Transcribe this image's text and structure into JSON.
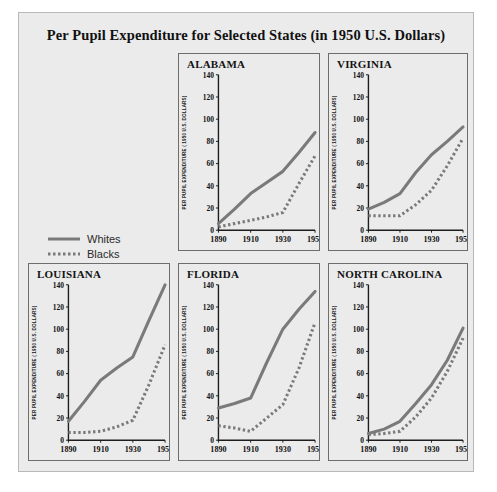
{
  "figure": {
    "title": "Per Pupil Expenditure for Selected States (in 1950 U.S. Dollars)"
  },
  "legend": {
    "whites_label": "Whites",
    "blacks_label": "Blacks",
    "whites_style": "solid",
    "blacks_style": "dotted",
    "line_color": "#7a7a7a"
  },
  "axis": {
    "ylabel": "PER PUPIL EXPENDITURE ( 1950 U.S. DOLLARS)",
    "yticks": [
      0,
      20,
      40,
      60,
      80,
      100,
      120,
      140
    ],
    "xticks": [
      1890,
      1910,
      1930,
      1950
    ],
    "ylim": [
      0,
      140
    ],
    "xlim": [
      1890,
      1950
    ]
  },
  "chart_data": [
    {
      "type": "line",
      "title": "ALABAMA",
      "xlabel": "",
      "ylabel": "PER PUPIL EXPENDITURE ( 1950 U.S. DOLLARS)",
      "xlim": [
        1890,
        1950
      ],
      "ylim": [
        0,
        140
      ],
      "xticks": [
        1890,
        1910,
        1930,
        1950
      ],
      "yticks": [
        0,
        20,
        40,
        60,
        80,
        100,
        120,
        140
      ],
      "grid": false,
      "legend_position": "figure-left",
      "x": [
        1890,
        1900,
        1910,
        1920,
        1930,
        1940,
        1950
      ],
      "series": [
        {
          "name": "Whites",
          "style": "solid",
          "values": [
            6,
            19,
            33,
            43,
            53,
            70,
            88
          ]
        },
        {
          "name": "Blacks",
          "style": "dotted",
          "values": [
            3,
            6,
            9,
            12,
            16,
            42,
            67
          ]
        }
      ]
    },
    {
      "type": "line",
      "title": "VIRGINIA",
      "xlabel": "",
      "ylabel": "PER PUPIL EXPENDITURE ( 1950 U.S. DOLLARS)",
      "xlim": [
        1890,
        1950
      ],
      "ylim": [
        0,
        140
      ],
      "xticks": [
        1890,
        1910,
        1930,
        1950
      ],
      "yticks": [
        0,
        20,
        40,
        60,
        80,
        100,
        120,
        140
      ],
      "grid": false,
      "legend_position": "figure-left",
      "x": [
        1890,
        1900,
        1910,
        1920,
        1930,
        1940,
        1950
      ],
      "series": [
        {
          "name": "Whites",
          "style": "solid",
          "values": [
            19,
            25,
            33,
            52,
            68,
            80,
            93
          ]
        },
        {
          "name": "Blacks",
          "style": "dotted",
          "values": [
            13,
            13,
            13,
            23,
            36,
            58,
            83
          ]
        }
      ]
    },
    {
      "type": "line",
      "title": "LOUISIANA",
      "xlabel": "",
      "ylabel": "PER PUPIL EXPENDITURE ( 1950 U.S. DOLLARS)",
      "xlim": [
        1890,
        1950
      ],
      "ylim": [
        0,
        140
      ],
      "xticks": [
        1890,
        1910,
        1930,
        1950
      ],
      "yticks": [
        0,
        20,
        40,
        60,
        80,
        100,
        120,
        140
      ],
      "grid": false,
      "legend_position": "figure-left",
      "x": [
        1890,
        1900,
        1910,
        1920,
        1930,
        1940,
        1950
      ],
      "series": [
        {
          "name": "Whites",
          "style": "solid",
          "values": [
            17,
            35,
            54,
            65,
            75,
            108,
            140
          ]
        },
        {
          "name": "Blacks",
          "style": "dotted",
          "values": [
            7,
            7,
            8,
            12,
            18,
            50,
            86
          ]
        }
      ]
    },
    {
      "type": "line",
      "title": "FLORIDA",
      "xlabel": "",
      "ylabel": "PER PUPIL EXPENDITURE ( 1950 U.S. DOLLARS)",
      "xlim": [
        1890,
        1950
      ],
      "ylim": [
        0,
        140
      ],
      "xticks": [
        1890,
        1910,
        1930,
        1950
      ],
      "yticks": [
        0,
        20,
        40,
        60,
        80,
        100,
        120,
        140
      ],
      "grid": false,
      "legend_position": "figure-left",
      "x": [
        1890,
        1900,
        1910,
        1920,
        1930,
        1940,
        1950
      ],
      "series": [
        {
          "name": "Whites",
          "style": "solid",
          "values": [
            29,
            33,
            38,
            70,
            100,
            118,
            134
          ]
        },
        {
          "name": "Blacks",
          "style": "dotted",
          "values": [
            13,
            11,
            8,
            20,
            32,
            65,
            106
          ]
        }
      ]
    },
    {
      "type": "line",
      "title": "NORTH CAROLINA",
      "xlabel": "",
      "ylabel": "PER PUPIL EXPENDITURE ( 1950 U.S. DOLLARS)",
      "xlim": [
        1890,
        1950
      ],
      "ylim": [
        0,
        140
      ],
      "xticks": [
        1890,
        1910,
        1930,
        1950
      ],
      "yticks": [
        0,
        20,
        40,
        60,
        80,
        100,
        120,
        140
      ],
      "grid": false,
      "legend_position": "figure-left",
      "x": [
        1890,
        1900,
        1910,
        1920,
        1930,
        1940,
        1950
      ],
      "series": [
        {
          "name": "Whites",
          "style": "solid",
          "values": [
            6,
            10,
            17,
            33,
            50,
            72,
            101
          ]
        },
        {
          "name": "Blacks",
          "style": "dotted",
          "values": [
            5,
            6,
            8,
            21,
            38,
            62,
            92
          ]
        }
      ]
    }
  ]
}
